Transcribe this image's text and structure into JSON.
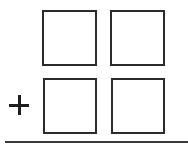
{
  "problem": {
    "operator": "plus",
    "operator_symbol": "+",
    "rows": [
      {
        "boxes": [
          {
            "value": ""
          },
          {
            "value": ""
          }
        ]
      },
      {
        "boxes": [
          {
            "value": ""
          },
          {
            "value": ""
          }
        ]
      }
    ],
    "answer_line": true
  },
  "colors": {
    "stroke": "#2b2b2b",
    "background": "#ffffff"
  }
}
